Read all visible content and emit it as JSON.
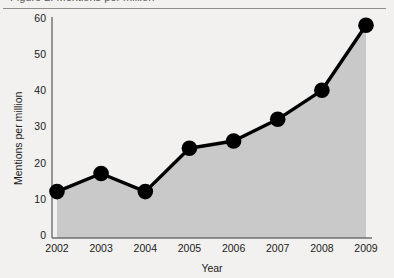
{
  "page": {
    "top_cropped_text": "Figure 2. Mentions per million"
  },
  "chart_data": {
    "type": "area",
    "title": "",
    "subtitle": "",
    "xlabel": "Year",
    "ylabel": "Mentions per million",
    "categories": [
      "2002",
      "2003",
      "2004",
      "2005",
      "2006",
      "2007",
      "2008",
      "2009"
    ],
    "values": [
      12,
      17,
      12,
      24,
      26,
      32,
      40,
      58
    ],
    "series": [
      {
        "name": "Mentions per million",
        "values": [
          12,
          17,
          12,
          24,
          26,
          32,
          40,
          58
        ]
      }
    ],
    "xlim": [
      2002,
      2009
    ],
    "ylim": [
      0,
      60
    ],
    "yticks": [
      0,
      10,
      20,
      30,
      40,
      50,
      60
    ],
    "ytick_labels": [
      "0",
      "10",
      "20",
      "30",
      "40",
      "50",
      "60"
    ],
    "xticks": [
      2002,
      2003,
      2004,
      2005,
      2006,
      2007,
      2008,
      2009
    ],
    "xtick_labels": [
      "2002",
      "2003",
      "2004",
      "2005",
      "2006",
      "2007",
      "2008",
      "2009"
    ],
    "grid": false,
    "legend": false,
    "legend_position": "none",
    "marker": "circle",
    "colors": {
      "line": "#000000",
      "marker": "#000000",
      "fill": "#c9c9c9",
      "axis": "#6e6e6e",
      "text": "#1b1b1b",
      "background": "#f2f1ef",
      "rule": "#8d8d8d"
    }
  }
}
